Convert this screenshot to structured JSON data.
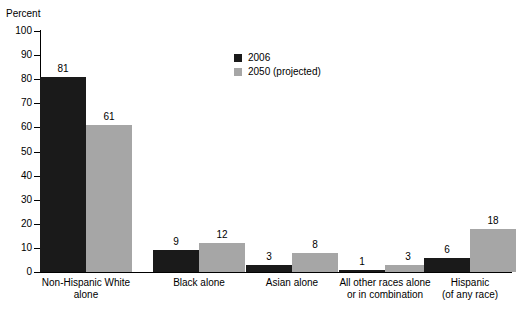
{
  "chart_data": {
    "type": "bar",
    "title": "",
    "xlabel": "",
    "ylabel": "Percent",
    "ylim": [
      0,
      100
    ],
    "yticks": [
      0,
      10,
      20,
      30,
      40,
      50,
      60,
      70,
      80,
      90,
      100
    ],
    "grid": false,
    "legend_position": "top-center",
    "categories": [
      "Non-Hispanic White\nalone",
      "Black alone",
      "Asian alone",
      "All other races alone\nor in combination",
      "Hispanic\n(of any race)"
    ],
    "series": [
      {
        "name": "2006",
        "color": "#1a1a1a",
        "values": [
          81,
          9,
          3,
          1,
          6
        ]
      },
      {
        "name": "2050 (projected)",
        "color": "#a6a6a6",
        "values": [
          61,
          12,
          8,
          3,
          18
        ]
      }
    ]
  },
  "legend": {
    "entries": [
      {
        "label": "2006"
      },
      {
        "label": "2050 (projected)"
      }
    ]
  },
  "axis": {
    "y_title": "Percent"
  },
  "footer": {
    "clipped_caption": ""
  }
}
